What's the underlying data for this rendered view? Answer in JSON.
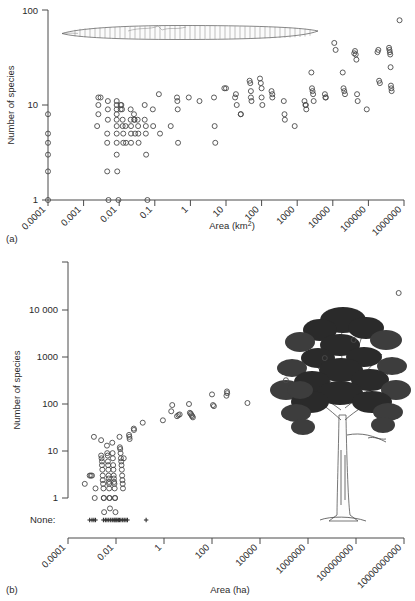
{
  "figure": {
    "panels": [
      {
        "id": "a",
        "label": "(a)",
        "illustration": "earthworm-illustration"
      },
      {
        "id": "b",
        "label": "(b)",
        "illustration": "tree-illustration",
        "none_label": "None:"
      }
    ]
  },
  "chart_data": [
    {
      "type": "scatter",
      "title": "",
      "panel": "(a)",
      "xlabel": "Area (km²)",
      "ylabel": "Number of species",
      "xscale": "log",
      "yscale": "log",
      "xlim": [
        0.0001,
        1000000
      ],
      "ylim": [
        1,
        100
      ],
      "xticks": [
        0.0001,
        0.001,
        0.01,
        0.1,
        1,
        10,
        100,
        1000,
        10000,
        100000,
        1000000
      ],
      "xtick_labels": [
        "0.0001",
        "0.001",
        "0.01",
        "0.1",
        "1",
        "10",
        "100",
        "1000",
        "10000",
        "100000",
        "1000000"
      ],
      "yticks": [
        1,
        10,
        100
      ],
      "ytick_labels": [
        "1",
        "10",
        "100"
      ],
      "grid": false,
      "legend": "none",
      "marker": "open-circle",
      "annotation": "earthworm illustration spanning approx. 0.0006 to 3000 km² at ~50 species height",
      "points": [
        [
          0.0001,
          8
        ],
        [
          0.0001,
          5
        ],
        [
          0.0001,
          4
        ],
        [
          0.0001,
          3
        ],
        [
          0.0001,
          2
        ],
        [
          0.0001,
          1
        ],
        [
          0.0026,
          10
        ],
        [
          0.003,
          12
        ],
        [
          0.0026,
          12
        ],
        [
          0.0026,
          8
        ],
        [
          0.0024,
          6
        ],
        [
          0.0048,
          11
        ],
        [
          0.0048,
          9
        ],
        [
          0.0048,
          7
        ],
        [
          0.0046,
          5
        ],
        [
          0.0046,
          4
        ],
        [
          0.0046,
          2
        ],
        [
          0.005,
          1
        ],
        [
          0.0085,
          11
        ],
        [
          0.0085,
          10
        ],
        [
          0.0085,
          9
        ],
        [
          0.0085,
          8
        ],
        [
          0.0085,
          7
        ],
        [
          0.0085,
          6
        ],
        [
          0.0085,
          5
        ],
        [
          0.0085,
          4
        ],
        [
          0.0085,
          3
        ],
        [
          0.0088,
          2
        ],
        [
          0.0095,
          1
        ],
        [
          0.011,
          10
        ],
        [
          0.011,
          9
        ],
        [
          0.0115,
          10
        ],
        [
          0.012,
          9
        ],
        [
          0.0125,
          7
        ],
        [
          0.0125,
          6
        ],
        [
          0.013,
          5
        ],
        [
          0.013,
          4
        ],
        [
          0.015,
          6
        ],
        [
          0.0155,
          4
        ],
        [
          0.021,
          9
        ],
        [
          0.021,
          7
        ],
        [
          0.0215,
          6
        ],
        [
          0.0215,
          5
        ],
        [
          0.0215,
          4
        ],
        [
          0.026,
          8
        ],
        [
          0.0265,
          7
        ],
        [
          0.027,
          7
        ],
        [
          0.028,
          5
        ],
        [
          0.033,
          7
        ],
        [
          0.034,
          6
        ],
        [
          0.0345,
          5
        ],
        [
          0.035,
          4
        ],
        [
          0.052,
          10
        ],
        [
          0.052,
          7
        ],
        [
          0.056,
          6
        ],
        [
          0.056,
          5
        ],
        [
          0.057,
          3
        ],
        [
          0.062,
          1
        ],
        [
          0.088,
          9
        ],
        [
          0.09,
          6
        ],
        [
          0.13,
          13
        ],
        [
          0.14,
          5
        ],
        [
          0.28,
          6
        ],
        [
          0.42,
          12
        ],
        [
          0.43,
          11
        ],
        [
          0.44,
          9
        ],
        [
          0.45,
          4
        ],
        [
          0.9,
          12
        ],
        [
          1.8,
          11
        ],
        [
          4.6,
          12
        ],
        [
          4.8,
          6
        ],
        [
          5.0,
          4
        ],
        [
          9.0,
          15
        ],
        [
          10.0,
          15
        ],
        [
          18.0,
          12
        ],
        [
          19.0,
          13
        ],
        [
          20.0,
          10
        ],
        [
          26.0,
          8
        ],
        [
          26.0,
          8
        ],
        [
          46.0,
          18
        ],
        [
          48.0,
          17
        ],
        [
          50.0,
          14
        ],
        [
          50.0,
          12
        ],
        [
          52.0,
          11
        ],
        [
          90.0,
          19
        ],
        [
          95.0,
          17
        ],
        [
          100.0,
          15
        ],
        [
          100.0,
          12
        ],
        [
          105.0,
          10
        ],
        [
          190.0,
          14
        ],
        [
          200.0,
          13
        ],
        [
          200.0,
          12
        ],
        [
          420.0,
          11
        ],
        [
          440.0,
          8
        ],
        [
          450.0,
          7
        ],
        [
          850.0,
          6
        ],
        [
          1600,
          11
        ],
        [
          1700,
          10
        ],
        [
          1750,
          10
        ],
        [
          1800,
          9
        ],
        [
          2500,
          22
        ],
        [
          2600,
          15
        ],
        [
          2700,
          14
        ],
        [
          2800,
          13
        ],
        [
          2900,
          11
        ],
        [
          6000,
          13
        ],
        [
          6200,
          12
        ],
        [
          6400,
          12
        ],
        [
          11000,
          45
        ],
        [
          12000,
          38
        ],
        [
          19000,
          22
        ],
        [
          20000,
          15
        ],
        [
          21000,
          14
        ],
        [
          22000,
          13
        ],
        [
          40000,
          35
        ],
        [
          42000,
          37
        ],
        [
          44000,
          34
        ],
        [
          46000,
          30
        ],
        [
          48000,
          13
        ],
        [
          50000,
          11
        ],
        [
          90000,
          9
        ],
        [
          180000,
          36
        ],
        [
          190000,
          38
        ],
        [
          200000,
          18
        ],
        [
          210000,
          17
        ],
        [
          380000,
          40
        ],
        [
          390000,
          38
        ],
        [
          400000,
          36
        ],
        [
          410000,
          34
        ],
        [
          420000,
          25
        ],
        [
          430000,
          16
        ],
        [
          440000,
          15
        ],
        [
          450000,
          14
        ],
        [
          750000,
          78
        ]
      ]
    },
    {
      "type": "scatter",
      "title": "",
      "panel": "(b)",
      "xlabel": "Area (ha)",
      "ylabel": "Number of species",
      "xscale": "log",
      "yscale": "log",
      "xlim": [
        0.0001,
        10000000000
      ],
      "ylim": [
        0.4,
        30000
      ],
      "xticks": [
        0.0001,
        0.01,
        1,
        100,
        10000,
        1000000,
        100000000,
        10000000000
      ],
      "xtick_labels": [
        "0.0001",
        "0.01",
        "1",
        "100",
        "10000",
        "1000000",
        "100000000",
        "10000000000"
      ],
      "yticks": [
        1,
        10,
        100,
        1000,
        10000
      ],
      "ytick_labels": [
        "1",
        "10",
        "100",
        "1000",
        "10 000"
      ],
      "grid": false,
      "legend": "none",
      "marker": "open-circle",
      "annotation": "tree illustration at right; 'None:' row of plus markers below axis marks sites with zero species",
      "points": [
        [
          0.0005,
          2
        ],
        [
          0.0008,
          3
        ],
        [
          0.0009,
          3
        ],
        [
          0.001,
          3
        ],
        [
          0.0012,
          20
        ],
        [
          0.0013,
          1
        ],
        [
          0.0014,
          1.6
        ],
        [
          0.0024,
          17
        ],
        [
          0.0024,
          8
        ],
        [
          0.0025,
          7
        ],
        [
          0.0026,
          6
        ],
        [
          0.0026,
          5
        ],
        [
          0.0027,
          4
        ],
        [
          0.0028,
          3
        ],
        [
          0.0028,
          2.4
        ],
        [
          0.0029,
          2
        ],
        [
          0.003,
          1.6
        ],
        [
          0.0031,
          1
        ],
        [
          0.0031,
          1
        ],
        [
          0.0032,
          0.5
        ],
        [
          0.0042,
          13
        ],
        [
          0.0043,
          9
        ],
        [
          0.0045,
          8
        ],
        [
          0.0046,
          6
        ],
        [
          0.0047,
          5
        ],
        [
          0.0048,
          4
        ],
        [
          0.0049,
          3
        ],
        [
          0.005,
          2.6
        ],
        [
          0.0051,
          2.2
        ],
        [
          0.0052,
          2
        ],
        [
          0.0052,
          1.6
        ],
        [
          0.0053,
          1
        ],
        [
          0.0054,
          1
        ],
        [
          0.0056,
          0.6
        ],
        [
          0.007,
          15
        ],
        [
          0.0072,
          9
        ],
        [
          0.0074,
          7
        ],
        [
          0.0076,
          5
        ],
        [
          0.0078,
          4
        ],
        [
          0.008,
          3
        ],
        [
          0.0082,
          2.6
        ],
        [
          0.0084,
          2.2
        ],
        [
          0.0086,
          2
        ],
        [
          0.0088,
          1.6
        ],
        [
          0.009,
          1
        ],
        [
          0.0092,
          1
        ],
        [
          0.0095,
          0.5
        ],
        [
          0.014,
          20
        ],
        [
          0.0145,
          12
        ],
        [
          0.015,
          11
        ],
        [
          0.0155,
          9
        ],
        [
          0.016,
          7
        ],
        [
          0.0165,
          6
        ],
        [
          0.017,
          5
        ],
        [
          0.0175,
          4
        ],
        [
          0.018,
          3
        ],
        [
          0.0185,
          2.4
        ],
        [
          0.019,
          2
        ],
        [
          0.0195,
          1.6
        ],
        [
          0.021,
          7
        ],
        [
          0.035,
          22
        ],
        [
          0.036,
          20
        ],
        [
          0.037,
          18
        ],
        [
          0.055,
          30
        ],
        [
          0.056,
          28
        ],
        [
          0.13,
          40
        ],
        [
          0.9,
          45
        ],
        [
          2.0,
          70
        ],
        [
          2.2,
          95
        ],
        [
          3.5,
          55
        ],
        [
          4.0,
          58
        ],
        [
          4.5,
          60
        ],
        [
          11.0,
          100
        ],
        [
          12.0,
          65
        ],
        [
          13.0,
          62
        ],
        [
          14.0,
          58
        ],
        [
          15.0,
          55
        ],
        [
          16.0,
          52
        ],
        [
          100.0,
          160
        ],
        [
          110.0,
          95
        ],
        [
          120.0,
          90
        ],
        [
          400.0,
          150
        ],
        [
          420.0,
          185
        ],
        [
          430.0,
          170
        ],
        [
          3000.0,
          105
        ],
        [
          120000,
          320
        ],
        [
          5000000,
          950
        ],
        [
          80000000,
          2300
        ],
        [
          6000000000,
          23000
        ]
      ],
      "none_markers": {
        "label": "None:",
        "x_values": [
          0.0008,
          0.001,
          0.0012,
          0.0014,
          0.003,
          0.0036,
          0.0042,
          0.005,
          0.006,
          0.007,
          0.0082,
          0.009,
          0.01,
          0.011,
          0.0125,
          0.014,
          0.016,
          0.019,
          0.022,
          0.026,
          0.03,
          0.18
        ]
      }
    }
  ]
}
